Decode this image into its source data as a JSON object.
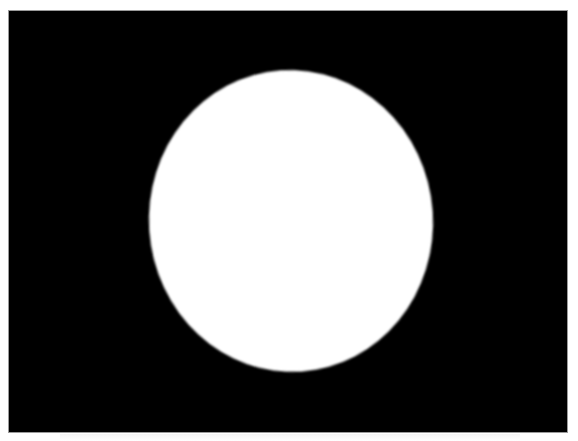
{
  "image": {
    "description": "White elliptical disc on black background inside a thin gray-bordered frame",
    "colors": {
      "background_page": "#ffffff",
      "frame_fill": "#000000",
      "frame_border": "#9a9a9a",
      "disc_fill": "#ffffff"
    },
    "frame": {
      "x": 9,
      "y": 11,
      "width": 558,
      "height": 421
    },
    "disc": {
      "center_x": 291,
      "center_y": 221,
      "width": 284,
      "height": 302
    }
  },
  "caption": {
    "text": "",
    "legible": false
  }
}
